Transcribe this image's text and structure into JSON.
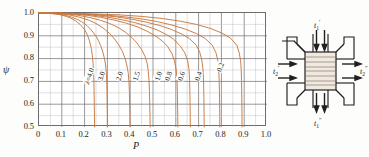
{
  "chart_data": {
    "type": "line",
    "title": "",
    "xlabel": "P",
    "ylabel": "ψ",
    "xlim": [
      0,
      1.0
    ],
    "ylim": [
      0.5,
      1.0
    ],
    "xticks": [
      "0",
      "0.1",
      "0.2",
      "0.3",
      "0.4",
      "0.5",
      "0.6",
      "0.7",
      "0.8",
      "0.9",
      "1.0"
    ],
    "yticks": [
      "0.5",
      "0.6",
      "0.7",
      "0.8",
      "0.9",
      "1.0"
    ],
    "grid": "major at 0.1 (x) / 0.1 (y), minor at 0.05 (x) / 0.05 (y)",
    "legend_position": "inline curve labels",
    "curve_color": "#c8793f",
    "grid_color": "#6d6d6d",
    "minor_grid_color": "#b9b9b9",
    "parameter_symbol": "λ",
    "series": [
      {
        "name": "4.0",
        "label": "λ=4.0",
        "label_x": 0.223,
        "label_y": 0.718,
        "asymptote_x": 0.243,
        "points": [
          [
            0.0,
            1.0
          ],
          [
            0.03,
            0.999
          ],
          [
            0.06,
            0.997
          ],
          [
            0.09,
            0.993
          ],
          [
            0.12,
            0.985
          ],
          [
            0.14,
            0.977
          ],
          [
            0.16,
            0.966
          ],
          [
            0.18,
            0.95
          ],
          [
            0.19,
            0.939
          ],
          [
            0.2,
            0.926
          ],
          [
            0.21,
            0.908
          ],
          [
            0.215,
            0.896
          ],
          [
            0.22,
            0.882
          ],
          [
            0.225,
            0.864
          ],
          [
            0.23,
            0.84
          ],
          [
            0.234,
            0.812
          ],
          [
            0.237,
            0.782
          ],
          [
            0.239,
            0.75
          ],
          [
            0.2405,
            0.71
          ],
          [
            0.2415,
            0.66
          ],
          [
            0.2425,
            0.6
          ],
          [
            0.2432,
            0.545
          ],
          [
            0.2437,
            0.5
          ]
        ]
      },
      {
        "name": "3.0",
        "label": "3.0",
        "label_x": 0.276,
        "label_y": 0.718,
        "asymptote_x": 0.3,
        "points": [
          [
            0.0,
            1.0
          ],
          [
            0.04,
            0.999
          ],
          [
            0.08,
            0.996
          ],
          [
            0.11,
            0.991
          ],
          [
            0.14,
            0.983
          ],
          [
            0.17,
            0.971
          ],
          [
            0.19,
            0.96
          ],
          [
            0.21,
            0.945
          ],
          [
            0.23,
            0.925
          ],
          [
            0.25,
            0.898
          ],
          [
            0.26,
            0.88
          ],
          [
            0.27,
            0.858
          ],
          [
            0.28,
            0.829
          ],
          [
            0.287,
            0.801
          ],
          [
            0.292,
            0.772
          ],
          [
            0.295,
            0.742
          ],
          [
            0.2972,
            0.7
          ],
          [
            0.2985,
            0.65
          ],
          [
            0.2993,
            0.595
          ],
          [
            0.2998,
            0.545
          ],
          [
            0.3,
            0.5
          ]
        ]
      },
      {
        "name": "2.0",
        "label": "2.0",
        "label_x": 0.355,
        "label_y": 0.718,
        "asymptote_x": 0.398,
        "points": [
          [
            0.0,
            1.0
          ],
          [
            0.05,
            0.999
          ],
          [
            0.1,
            0.996
          ],
          [
            0.14,
            0.99
          ],
          [
            0.18,
            0.981
          ],
          [
            0.22,
            0.968
          ],
          [
            0.25,
            0.954
          ],
          [
            0.28,
            0.935
          ],
          [
            0.31,
            0.91
          ],
          [
            0.33,
            0.888
          ],
          [
            0.35,
            0.86
          ],
          [
            0.365,
            0.833
          ],
          [
            0.377,
            0.803
          ],
          [
            0.385,
            0.772
          ],
          [
            0.391,
            0.74
          ],
          [
            0.3945,
            0.7
          ],
          [
            0.3965,
            0.65
          ],
          [
            0.3978,
            0.595
          ],
          [
            0.3988,
            0.545
          ],
          [
            0.3995,
            0.5
          ]
        ]
      },
      {
        "name": "1.5",
        "label": "1.5",
        "label_x": 0.428,
        "label_y": 0.718,
        "asymptote_x": 0.486,
        "points": [
          [
            0.0,
            1.0
          ],
          [
            0.06,
            0.999
          ],
          [
            0.12,
            0.996
          ],
          [
            0.17,
            0.99
          ],
          [
            0.22,
            0.981
          ],
          [
            0.27,
            0.968
          ],
          [
            0.31,
            0.954
          ],
          [
            0.35,
            0.935
          ],
          [
            0.38,
            0.915
          ],
          [
            0.41,
            0.89
          ],
          [
            0.43,
            0.868
          ],
          [
            0.45,
            0.84
          ],
          [
            0.465,
            0.81
          ],
          [
            0.474,
            0.78
          ],
          [
            0.479,
            0.748
          ],
          [
            0.4825,
            0.705
          ],
          [
            0.4845,
            0.655
          ],
          [
            0.4858,
            0.598
          ],
          [
            0.4868,
            0.546
          ],
          [
            0.4875,
            0.5
          ]
        ]
      },
      {
        "name": "1.0",
        "label": "1.0",
        "label_x": 0.525,
        "label_y": 0.718,
        "asymptote_x": 0.608,
        "points": [
          [
            0.0,
            1.0
          ],
          [
            0.07,
            0.999
          ],
          [
            0.14,
            0.996
          ],
          [
            0.21,
            0.99
          ],
          [
            0.27,
            0.981
          ],
          [
            0.33,
            0.969
          ],
          [
            0.38,
            0.956
          ],
          [
            0.43,
            0.94
          ],
          [
            0.47,
            0.922
          ],
          [
            0.51,
            0.9
          ],
          [
            0.54,
            0.878
          ],
          [
            0.565,
            0.852
          ],
          [
            0.583,
            0.822
          ],
          [
            0.594,
            0.79
          ],
          [
            0.6015,
            0.752
          ],
          [
            0.6053,
            0.708
          ],
          [
            0.6068,
            0.655
          ],
          [
            0.6078,
            0.598
          ],
          [
            0.6085,
            0.546
          ],
          [
            0.609,
            0.5
          ]
        ]
      },
      {
        "name": "0.8",
        "label": "0.8",
        "label_x": 0.57,
        "label_y": 0.718,
        "asymptote_x": 0.66,
        "points": [
          [
            0.0,
            1.0
          ],
          [
            0.08,
            0.999
          ],
          [
            0.16,
            0.996
          ],
          [
            0.23,
            0.991
          ],
          [
            0.3,
            0.982
          ],
          [
            0.36,
            0.971
          ],
          [
            0.42,
            0.958
          ],
          [
            0.47,
            0.943
          ],
          [
            0.52,
            0.925
          ],
          [
            0.56,
            0.905
          ],
          [
            0.59,
            0.885
          ],
          [
            0.62,
            0.855
          ],
          [
            0.64,
            0.824
          ],
          [
            0.652,
            0.79
          ],
          [
            0.658,
            0.752
          ],
          [
            0.6605,
            0.705
          ],
          [
            0.6618,
            0.652
          ],
          [
            0.6627,
            0.597
          ],
          [
            0.6633,
            0.546
          ],
          [
            0.6638,
            0.5
          ]
        ]
      },
      {
        "name": "0.6",
        "label": "0.6",
        "label_x": 0.625,
        "label_y": 0.718,
        "asymptote_x": 0.722,
        "points": [
          [
            0.0,
            1.0
          ],
          [
            0.09,
            0.999
          ],
          [
            0.18,
            0.996
          ],
          [
            0.26,
            0.991
          ],
          [
            0.34,
            0.983
          ],
          [
            0.41,
            0.972
          ],
          [
            0.47,
            0.96
          ],
          [
            0.53,
            0.945
          ],
          [
            0.58,
            0.928
          ],
          [
            0.63,
            0.906
          ],
          [
            0.66,
            0.888
          ],
          [
            0.69,
            0.858
          ],
          [
            0.705,
            0.828
          ],
          [
            0.714,
            0.795
          ],
          [
            0.719,
            0.755
          ],
          [
            0.7215,
            0.706
          ],
          [
            0.7228,
            0.652
          ],
          [
            0.7236,
            0.597
          ],
          [
            0.7242,
            0.546
          ],
          [
            0.7246,
            0.5
          ]
        ]
      },
      {
        "name": "0.4",
        "label": "0.4",
        "label_x": 0.7,
        "label_y": 0.718,
        "asymptote_x": 0.79,
        "points": [
          [
            0.0,
            1.0
          ],
          [
            0.1,
            0.999
          ],
          [
            0.2,
            0.996
          ],
          [
            0.29,
            0.991
          ],
          [
            0.37,
            0.984
          ],
          [
            0.45,
            0.974
          ],
          [
            0.52,
            0.962
          ],
          [
            0.58,
            0.948
          ],
          [
            0.64,
            0.93
          ],
          [
            0.69,
            0.91
          ],
          [
            0.73,
            0.888
          ],
          [
            0.76,
            0.858
          ],
          [
            0.776,
            0.826
          ],
          [
            0.784,
            0.793
          ],
          [
            0.788,
            0.754
          ],
          [
            0.7903,
            0.705
          ],
          [
            0.7915,
            0.652
          ],
          [
            0.7923,
            0.597
          ],
          [
            0.7928,
            0.546
          ],
          [
            0.7932,
            0.5
          ]
        ]
      },
      {
        "name": "0.2",
        "label": "0.2",
        "label_x": 0.8,
        "label_y": 0.76,
        "asymptote_x": 0.888,
        "points": [
          [
            0.0,
            1.0
          ],
          [
            0.12,
            0.999
          ],
          [
            0.24,
            0.996
          ],
          [
            0.35,
            0.992
          ],
          [
            0.45,
            0.985
          ],
          [
            0.54,
            0.976
          ],
          [
            0.62,
            0.964
          ],
          [
            0.69,
            0.95
          ],
          [
            0.75,
            0.933
          ],
          [
            0.8,
            0.913
          ],
          [
            0.84,
            0.89
          ],
          [
            0.868,
            0.858
          ],
          [
            0.878,
            0.825
          ],
          [
            0.8845,
            0.79
          ],
          [
            0.8868,
            0.752
          ],
          [
            0.8882,
            0.705
          ],
          [
            0.8892,
            0.652
          ],
          [
            0.8898,
            0.597
          ],
          [
            0.8902,
            0.546
          ],
          [
            0.8905,
            0.5
          ]
        ]
      }
    ]
  },
  "diagram": {
    "name": "cross-flow-heat-exchanger",
    "labels": {
      "top": "t₁′",
      "bottom": "t₁″",
      "left": "t₂′",
      "right": "t₂″"
    },
    "label_parts": {
      "top": {
        "base": "t",
        "sub": "1",
        "sup": "′"
      },
      "bottom": {
        "base": "t",
        "sub": "1",
        "sup": "″"
      },
      "left": {
        "base": "t",
        "sub": "2",
        "sup": "′"
      },
      "right": {
        "base": "t",
        "sub": "2",
        "sup": "″"
      }
    },
    "line_color": "#231f20",
    "core_fill": "#efe9e0"
  }
}
